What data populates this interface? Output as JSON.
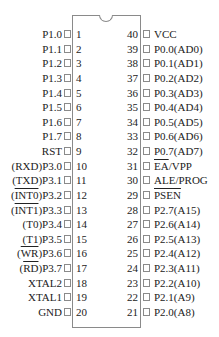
{
  "chip": {
    "notch": "top-center",
    "pin_count": 40
  },
  "left_pins": [
    {
      "num": "1",
      "pre": "",
      "ov": "",
      "post": "P1.0"
    },
    {
      "num": "2",
      "pre": "",
      "ov": "",
      "post": "P1.1"
    },
    {
      "num": "3",
      "pre": "",
      "ov": "",
      "post": "P1.2"
    },
    {
      "num": "4",
      "pre": "",
      "ov": "",
      "post": "P1.3"
    },
    {
      "num": "5",
      "pre": "",
      "ov": "",
      "post": "P1.4"
    },
    {
      "num": "6",
      "pre": "",
      "ov": "",
      "post": "P1.5"
    },
    {
      "num": "7",
      "pre": "",
      "ov": "",
      "post": "P1.6"
    },
    {
      "num": "8",
      "pre": "",
      "ov": "",
      "post": "P1.7"
    },
    {
      "num": "9",
      "pre": "",
      "ov": "",
      "post": "RST"
    },
    {
      "num": "10",
      "pre": "",
      "ov": "",
      "post": "(RXD)P3.0"
    },
    {
      "num": "11",
      "pre": "",
      "ov": "",
      "post": "(TXD)P3.1"
    },
    {
      "num": "12",
      "pre": "(",
      "ov": "INT0",
      "post": ")P3.2"
    },
    {
      "num": "13",
      "pre": "(",
      "ov": "INT1",
      "post": ")P3.3"
    },
    {
      "num": "14",
      "pre": "",
      "ov": "",
      "post": "(T0)P3.4"
    },
    {
      "num": "15",
      "pre": "",
      "ov": "",
      "post": "(T1)P3.5"
    },
    {
      "num": "16",
      "pre": "(",
      "ov": "WR",
      "post": ")P3.6"
    },
    {
      "num": "17",
      "pre": "(",
      "ov": "RD",
      "post": ")P3.7"
    },
    {
      "num": "18",
      "pre": "",
      "ov": "",
      "post": "XTAL2"
    },
    {
      "num": "19",
      "pre": "",
      "ov": "",
      "post": "XTAL1"
    },
    {
      "num": "20",
      "pre": "",
      "ov": "",
      "post": "GND"
    }
  ],
  "right_pins": [
    {
      "num": "40",
      "pre": "",
      "ov": "",
      "post": "VCC"
    },
    {
      "num": "39",
      "pre": "",
      "ov": "",
      "post": "P0.0(AD0)"
    },
    {
      "num": "38",
      "pre": "",
      "ov": "",
      "post": "P0.1(AD1)"
    },
    {
      "num": "37",
      "pre": "",
      "ov": "",
      "post": "P0.2(AD2)"
    },
    {
      "num": "36",
      "pre": "",
      "ov": "",
      "post": "P0.3(AD3)"
    },
    {
      "num": "35",
      "pre": "",
      "ov": "",
      "post": "P0.4(AD4)"
    },
    {
      "num": "34",
      "pre": "",
      "ov": "",
      "post": "P0.5(AD5)"
    },
    {
      "num": "33",
      "pre": "",
      "ov": "",
      "post": "P0.6(AD6)"
    },
    {
      "num": "32",
      "pre": "",
      "ov": "",
      "post": "P0.7(AD7)"
    },
    {
      "num": "31",
      "pre": "",
      "ov": "EA",
      "post": "/VPP"
    },
    {
      "num": "30",
      "pre": "",
      "ov": "",
      "post": "ALE/PROG"
    },
    {
      "num": "29",
      "pre": "",
      "ov": "PSEN",
      "post": ""
    },
    {
      "num": "28",
      "pre": "",
      "ov": "",
      "post": "P2.7(A15)"
    },
    {
      "num": "27",
      "pre": "",
      "ov": "",
      "post": "P2.6(A14)"
    },
    {
      "num": "26",
      "pre": "",
      "ov": "",
      "post": "P2.5(A13)"
    },
    {
      "num": "25",
      "pre": "",
      "ov": "",
      "post": "P2.4(A12)"
    },
    {
      "num": "24",
      "pre": "",
      "ov": "",
      "post": "P2.3(A11)"
    },
    {
      "num": "23",
      "pre": "",
      "ov": "",
      "post": "P2.2(A10)"
    },
    {
      "num": "22",
      "pre": "",
      "ov": "",
      "post": "P2.1(A9)"
    },
    {
      "num": "21",
      "pre": "",
      "ov": "",
      "post": "P2.0(A8)"
    }
  ]
}
